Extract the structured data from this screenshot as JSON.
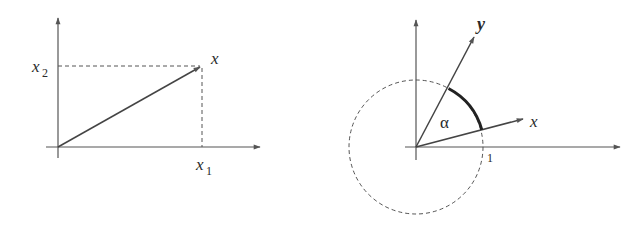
{
  "left_diagram": {
    "title": "vector in coordinates",
    "labels": {
      "vector": "x",
      "x1_base": "x",
      "x1_sub": "1",
      "x2_base": "x",
      "x2_sub": "2"
    },
    "geometry": {
      "origin": [
        58,
        147
      ],
      "x_axis_end": [
        262,
        147
      ],
      "y_axis_end": [
        58,
        16
      ],
      "vector_tip": [
        202,
        66
      ]
    }
  },
  "right_diagram": {
    "title": "angle between vectors on unit circle",
    "labels": {
      "vector_x": "x",
      "vector_y": "y",
      "angle": "α",
      "unit_mark": "1"
    },
    "geometry": {
      "origin": [
        416,
        147
      ],
      "x_axis_end": [
        622,
        147
      ],
      "y_axis_end": [
        416,
        18
      ],
      "unit_radius": 67,
      "vector_x_tip": [
        525,
        118
      ],
      "vector_y_tip": [
        475,
        35
      ]
    }
  },
  "colors": {
    "line": "#555555",
    "text": "#2a2a2a",
    "background": "#ffffff"
  }
}
